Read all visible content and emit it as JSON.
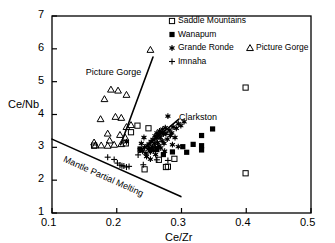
{
  "chart_data": {
    "type": "scatter",
    "title": "",
    "xlabel": "Ce/Zr",
    "ylabel": "Ce/Nb",
    "xlim": [
      0.1,
      0.5
    ],
    "ylim": [
      1,
      7
    ],
    "xticks": [
      "0.1",
      "0.2",
      "0.3",
      "0.4",
      "0.5"
    ],
    "xtick_values": [
      0.1,
      0.2,
      0.3,
      0.4,
      0.5
    ],
    "yticks": [
      "1",
      "2",
      "3",
      "4",
      "5",
      "6",
      "7"
    ],
    "ytick_values": [
      1,
      2,
      3,
      4,
      5,
      6,
      7
    ],
    "grid": false,
    "legend_position": "top-right",
    "series": [
      {
        "name": "Saddle Mountains",
        "marker": "open-square",
        "points": [
          [
            0.232,
            3.66
          ],
          [
            0.249,
            3.58
          ],
          [
            0.222,
            3.46
          ],
          [
            0.265,
            2.62
          ],
          [
            0.243,
            2.33
          ],
          [
            0.276,
            2.4
          ],
          [
            0.279,
            2.41
          ],
          [
            0.289,
            2.65
          ],
          [
            0.399,
            4.82
          ],
          [
            0.399,
            2.21
          ],
          [
            0.165,
            3.05
          ],
          [
            0.214,
            3.12
          ]
        ]
      },
      {
        "name": "Wanapum",
        "marker": "filled-square",
        "points": [
          [
            0.252,
            2.95
          ],
          [
            0.262,
            2.93
          ],
          [
            0.272,
            2.78
          ],
          [
            0.286,
            2.86
          ],
          [
            0.302,
            3.02
          ],
          [
            0.308,
            2.85
          ],
          [
            0.318,
            3.09
          ],
          [
            0.331,
            3.36
          ],
          [
            0.331,
            3.05
          ],
          [
            0.331,
            2.92
          ],
          [
            0.348,
            3.56
          ],
          [
            0.236,
            2.95
          ]
        ]
      },
      {
        "name": "Grande Ronde",
        "marker": "asterisk",
        "points": [
          [
            0.236,
            2.92
          ],
          [
            0.24,
            2.88
          ],
          [
            0.243,
            3.0
          ],
          [
            0.245,
            2.82
          ],
          [
            0.247,
            3.05
          ],
          [
            0.249,
            2.95
          ],
          [
            0.25,
            3.1
          ],
          [
            0.252,
            2.86
          ],
          [
            0.253,
            3.18
          ],
          [
            0.255,
            3.02
          ],
          [
            0.256,
            3.24
          ],
          [
            0.257,
            2.9
          ],
          [
            0.258,
            3.12
          ],
          [
            0.259,
            3.35
          ],
          [
            0.26,
            3.0
          ],
          [
            0.261,
            3.28
          ],
          [
            0.262,
            3.44
          ],
          [
            0.263,
            3.15
          ],
          [
            0.264,
            3.38
          ],
          [
            0.265,
            3.05
          ],
          [
            0.266,
            3.5
          ],
          [
            0.267,
            3.3
          ],
          [
            0.268,
            3.46
          ],
          [
            0.27,
            3.2
          ],
          [
            0.271,
            3.55
          ],
          [
            0.272,
            3.4
          ],
          [
            0.273,
            3.12
          ],
          [
            0.275,
            3.6
          ],
          [
            0.276,
            3.42
          ],
          [
            0.278,
            3.25
          ],
          [
            0.279,
            3.95
          ],
          [
            0.281,
            3.52
          ],
          [
            0.283,
            3.36
          ],
          [
            0.285,
            3.44
          ],
          [
            0.287,
            3.62
          ],
          [
            0.29,
            3.3
          ],
          [
            0.292,
            3.58
          ],
          [
            0.295,
            3.72
          ],
          [
            0.299,
            3.66
          ],
          [
            0.304,
            3.78
          ],
          [
            0.215,
            3.17
          ],
          [
            0.252,
            2.64
          ],
          [
            0.246,
            2.72
          ],
          [
            0.286,
            3.08
          ],
          [
            0.295,
            3.02
          ],
          [
            0.26,
            2.78
          ],
          [
            0.242,
            3.3
          ],
          [
            0.238,
            3.12
          ],
          [
            0.268,
            2.98
          ],
          [
            0.274,
            2.88
          ]
        ]
      },
      {
        "name": "Picture Gorge",
        "marker": "open-triangle",
        "points": [
          [
            0.252,
            5.97
          ],
          [
            0.191,
            4.76
          ],
          [
            0.202,
            4.73
          ],
          [
            0.181,
            4.47
          ],
          [
            0.215,
            4.6
          ],
          [
            0.175,
            3.86
          ],
          [
            0.198,
            3.93
          ],
          [
            0.207,
            3.9
          ],
          [
            0.222,
            3.68
          ],
          [
            0.215,
            3.62
          ],
          [
            0.186,
            3.42
          ],
          [
            0.205,
            3.38
          ],
          [
            0.189,
            3.21
          ],
          [
            0.165,
            3.15
          ],
          [
            0.167,
            3.06
          ],
          [
            0.176,
            3.06
          ],
          [
            0.186,
            3.05
          ],
          [
            0.196,
            3.08
          ],
          [
            0.207,
            3.1
          ],
          [
            0.213,
            3.3
          ]
        ]
      },
      {
        "name": "Imnaha",
        "marker": "plus",
        "points": [
          [
            0.186,
            2.7
          ],
          [
            0.196,
            2.63
          ],
          [
            0.201,
            2.52
          ],
          [
            0.205,
            2.46
          ],
          [
            0.208,
            2.44
          ],
          [
            0.211,
            2.43
          ],
          [
            0.215,
            2.4
          ],
          [
            0.219,
            2.42
          ],
          [
            0.233,
            2.77
          ],
          [
            0.241,
            2.47
          ],
          [
            0.262,
            2.62
          ],
          [
            0.279,
            2.6
          ]
        ]
      }
    ],
    "reference_lines": [
      {
        "name": "Picture Gorge",
        "from": [
          0.206,
          3.08
        ],
        "to": [
          0.256,
          5.75
        ]
      },
      {
        "name": "Clarkston",
        "from": [
          0.234,
          2.84
        ],
        "to": [
          0.296,
          3.86
        ]
      },
      {
        "name": "Mantle Partial Melting",
        "from": [
          0.1,
          3.25
        ],
        "to": [
          0.299,
          1.5
        ]
      }
    ],
    "annotations": [
      {
        "text": "Picture Gorge",
        "x": 0.152,
        "y": 5.45,
        "rotation": 0
      },
      {
        "text": "Clarkston",
        "x": 0.296,
        "y": 4.08,
        "rotation": 0
      },
      {
        "text": "Mantle Partial Melting",
        "x": 0.122,
        "y": 2.8,
        "rotation": 24
      }
    ]
  },
  "legend": {
    "entries": [
      {
        "label": "Saddle Mountains",
        "marker": "open-square"
      },
      {
        "label": "Wanapum",
        "marker": "filled-square"
      },
      {
        "label": "Grande Ronde",
        "marker": "asterisk"
      },
      {
        "label": "Picture Gorge",
        "marker": "open-triangle"
      },
      {
        "label": "Imnaha",
        "marker": "plus"
      }
    ]
  },
  "colors": {
    "axis": "#000000",
    "marker": "#000000",
    "background": "#ffffff"
  }
}
